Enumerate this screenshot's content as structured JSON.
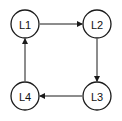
{
  "diagram": {
    "nodes": [
      {
        "id": "L1",
        "label": "L1"
      },
      {
        "id": "L2",
        "label": "L2"
      },
      {
        "id": "L3",
        "label": "L3"
      },
      {
        "id": "L4",
        "label": "L4"
      }
    ],
    "edges": [
      {
        "from": "L1",
        "to": "L2"
      },
      {
        "from": "L2",
        "to": "L3"
      },
      {
        "from": "L3",
        "to": "L4"
      },
      {
        "from": "L4",
        "to": "L1"
      }
    ]
  }
}
